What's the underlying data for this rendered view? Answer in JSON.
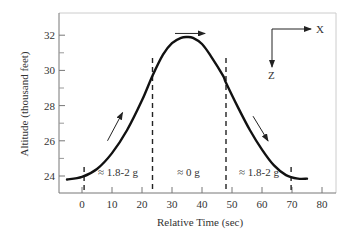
{
  "chart_data": {
    "type": "line",
    "title": "",
    "xlabel": "Relative Time (sec)",
    "ylabel": "Altitude (thousand feet)",
    "xlim": [
      -6,
      85
    ],
    "ylim": [
      23.3,
      33.2
    ],
    "grid": false,
    "legend": null,
    "x_ticks": [
      0,
      10,
      20,
      30,
      40,
      50,
      60,
      70,
      80
    ],
    "y_ticks": [
      24,
      26,
      28,
      30,
      32
    ],
    "y_minor_ticks": [
      25,
      27,
      29,
      31
    ],
    "series": [
      {
        "name": "Altitude",
        "x": [
          -5,
          0,
          5,
          10,
          15,
          20,
          23.5,
          27,
          30,
          33,
          35,
          37,
          40,
          43,
          47,
          48,
          52,
          56,
          60,
          64,
          68,
          72,
          75
        ],
        "y": [
          23.8,
          23.95,
          24.4,
          25.3,
          26.6,
          28.3,
          29.7,
          30.9,
          31.55,
          31.85,
          31.9,
          31.85,
          31.5,
          30.8,
          29.7,
          29.3,
          27.9,
          26.6,
          25.5,
          24.6,
          24.05,
          23.85,
          23.85
        ]
      }
    ],
    "phase_boundaries": [
      0.7,
      23.5,
      48,
      69.7
    ],
    "annotations": [
      {
        "text": "≈ 1.8-2  g",
        "x": 12,
        "y": 24.2,
        "region": "pull-up"
      },
      {
        "text": "≈  0 g",
        "x": 35.5,
        "y": 24.2,
        "region": "weightless"
      },
      {
        "text": "≈ 1.8-2  g",
        "x": 59,
        "y": 24.2,
        "region": "pull-out"
      }
    ],
    "direction_arrows": [
      {
        "from": [
          8.5,
          26.0
        ],
        "to": [
          13.5,
          27.6
        ],
        "meaning": "climbing"
      },
      {
        "from": [
          31,
          32.1
        ],
        "to": [
          41,
          32.1
        ],
        "meaning": "level over top"
      },
      {
        "from": [
          57,
          27.4
        ],
        "to": [
          62,
          26.0
        ],
        "meaning": "descending"
      }
    ],
    "coordinate_frame": {
      "x_label": "X",
      "z_label": "Z"
    }
  }
}
